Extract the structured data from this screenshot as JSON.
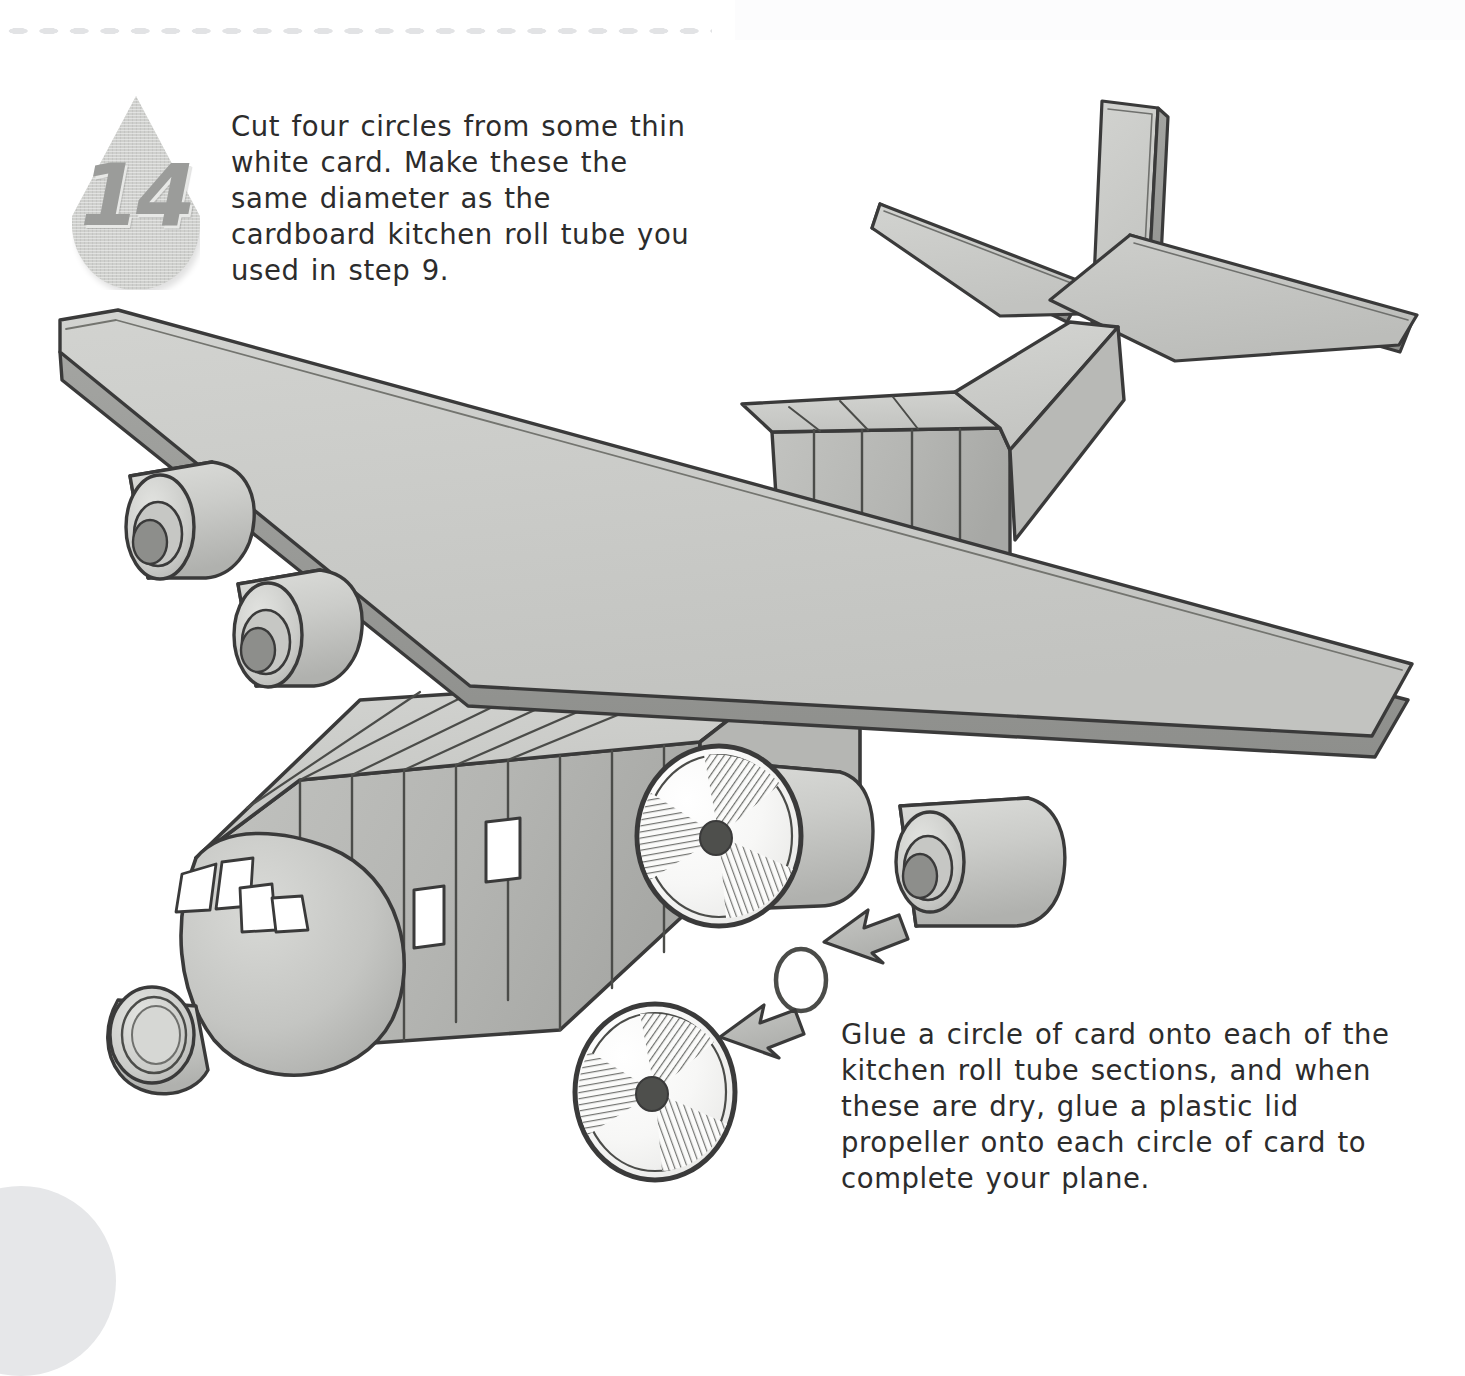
{
  "page": {
    "background_color": "#ffffff",
    "ink_color": "#2c2c2c",
    "body_gray": "#c9cac7",
    "shade_gray": "#a9aaa7",
    "dark_gray": "#8a8b88",
    "outline_color": "#3a3a3a",
    "dot_color": "#e2e3e5",
    "corner_blob_color": "#e6e7e9"
  },
  "step": {
    "number": "14",
    "badge_shape": "teardrop"
  },
  "instructions": {
    "top": "Cut four circles from some thin white card. Make these the same diameter as the cardboard kitchen roll tube you used in step 9.",
    "bottom": "Glue a circle of card onto each of the kitchen roll tube sections, and when these are dry, glue a plastic lid propeller onto each circle of card to complete your plane."
  },
  "illustration": {
    "subject": "cardboard model four-engine propeller plane",
    "parts": [
      {
        "name": "nose-cone",
        "label": "nose cone"
      },
      {
        "name": "cockpit-windows",
        "label": "cockpit windows",
        "count": 4
      },
      {
        "name": "fuselage-windows",
        "label": "fuselage windows",
        "count": 2
      },
      {
        "name": "forward-fuselage",
        "label": "forward fuselage box"
      },
      {
        "name": "rear-fuselage",
        "label": "rear fuselage box"
      },
      {
        "name": "main-wing",
        "label": "main wing"
      },
      {
        "name": "tail-fin",
        "label": "vertical tail fin"
      },
      {
        "name": "tailplane-left",
        "label": "left tailplane"
      },
      {
        "name": "tailplane-right",
        "label": "right tailplane"
      },
      {
        "name": "engine-1",
        "label": "engine nacelle 1"
      },
      {
        "name": "engine-2",
        "label": "engine nacelle 2"
      },
      {
        "name": "engine-3",
        "label": "engine nacelle 3"
      },
      {
        "name": "engine-4",
        "label": "engine nacelle 4"
      },
      {
        "name": "propeller-fitted",
        "label": "fitted propeller",
        "blades": 3
      },
      {
        "name": "propeller-loose",
        "label": "loose propeller",
        "blades": 3
      },
      {
        "name": "card-circle",
        "label": "circle of card"
      },
      {
        "name": "assembly-arrow-1",
        "label": "assembly arrow"
      },
      {
        "name": "assembly-arrow-2",
        "label": "assembly arrow"
      }
    ]
  }
}
